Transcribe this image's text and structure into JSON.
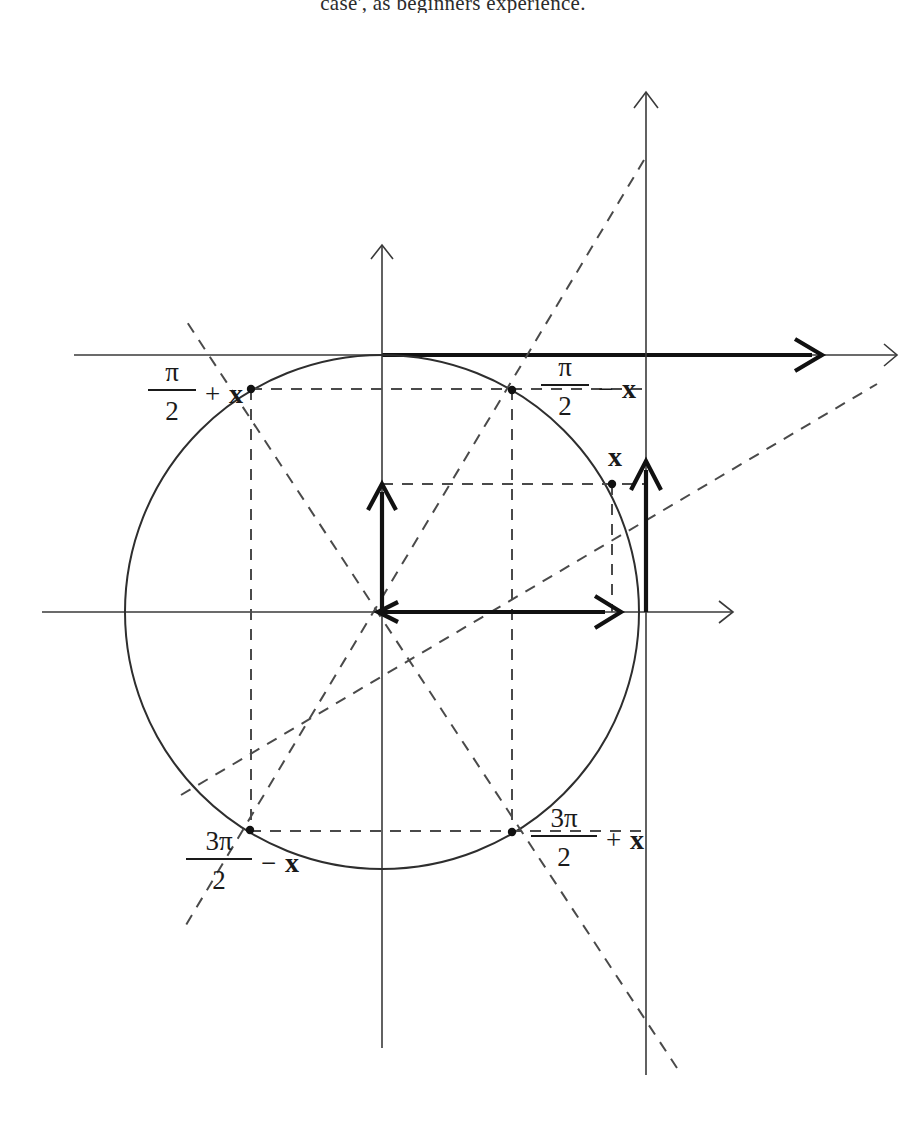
{
  "page": {
    "top_text": "case', as beginners experience.",
    "background": "#ffffff",
    "width": 906,
    "height": 1127
  },
  "figure": {
    "colors": {
      "stroke": "#2e2e2e",
      "dashed": "#4a4a4a",
      "bold_vector": "#111111",
      "label": "#1a1a1a"
    },
    "geometry": {
      "center_x": 382,
      "center_y": 612,
      "radius": 257,
      "x_axis_y": 612,
      "y_axis_x": 382,
      "tangent_line_x": 646,
      "top_line_y": 355
    },
    "labels": [
      {
        "id": "label-pi-over-2-plus-x",
        "numerator": "π",
        "denominator": "2",
        "operator": "+",
        "variable": "x",
        "x": 200,
        "y": 386
      },
      {
        "id": "label-pi-over-2-minus-x",
        "numerator": "π",
        "denominator": "2",
        "operator": "−",
        "variable": "x",
        "x": 560,
        "y": 381
      },
      {
        "id": "label-3pi-over-2-minus-x",
        "numerator": "3π",
        "denominator": "2",
        "operator": "−",
        "variable": "x",
        "x": 250,
        "y": 852
      },
      {
        "id": "label-3pi-over-2-plus-x",
        "numerator": "3π",
        "denominator": "2",
        "operator": "+",
        "variable": "x",
        "x": 596,
        "y": 830
      }
    ],
    "angle_label": {
      "id": "label-x",
      "variable": "x",
      "x": 617,
      "y": 460
    },
    "points": [
      {
        "id": "point-pi-over-2-plus-x",
        "x": 251,
        "y": 389
      },
      {
        "id": "point-pi-over-2-minus-x",
        "x": 512,
        "y": 390
      },
      {
        "id": "point-x",
        "x": 612,
        "y": 484
      },
      {
        "id": "point-3pi-over-2-minus-x",
        "x": 250,
        "y": 830
      },
      {
        "id": "point-3pi-over-2-plus-x",
        "x": 512,
        "y": 832
      }
    ]
  }
}
